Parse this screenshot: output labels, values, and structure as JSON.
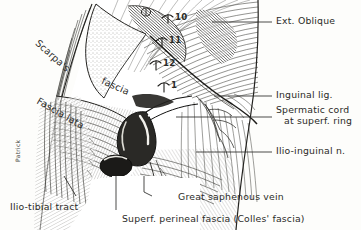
{
  "figure": {
    "style": "engraved line drawing",
    "ink_color": "#2b2b28",
    "paper_color": "#fdfdfb"
  },
  "signature": {
    "text": "Patrick"
  },
  "right_labels": [
    {
      "id": "ext-oblique",
      "text": "Ext. Oblique",
      "lines": [
        "Ext. Oblique"
      ]
    },
    {
      "id": "inguinal-lig",
      "text": "Inguinal lig.",
      "lines": [
        "Inguinal lig."
      ]
    },
    {
      "id": "spermatic-cord",
      "text": "Spermatic cord at superf. ring",
      "lines": [
        "Spermatic cord",
        "at superf. ring"
      ]
    },
    {
      "id": "ilio-inguinal-n",
      "text": "Ilio-inguinal n.",
      "lines": [
        "Ilio-inguinal n."
      ]
    }
  ],
  "bottom_labels": [
    {
      "id": "ilio-tibial-tract",
      "text": "Ilio-tibial  tract"
    },
    {
      "id": "great-saphenous-vein",
      "text": "Great saphenous vein"
    },
    {
      "id": "colles-fascia",
      "text": "Superf. perineal fascia (Colles' fascia)"
    }
  ],
  "inner_labels": [
    {
      "id": "scarpas",
      "text": "Scarpa's"
    },
    {
      "id": "fascia",
      "text": "fascia"
    },
    {
      "id": "fascia-lata",
      "text": "Fascia lata"
    }
  ],
  "numbered_markers": [
    {
      "id": "marker-10",
      "text": "10"
    },
    {
      "id": "marker-11",
      "text": "11"
    },
    {
      "id": "marker-12",
      "text": "12"
    },
    {
      "id": "marker-1",
      "text": "1"
    }
  ]
}
